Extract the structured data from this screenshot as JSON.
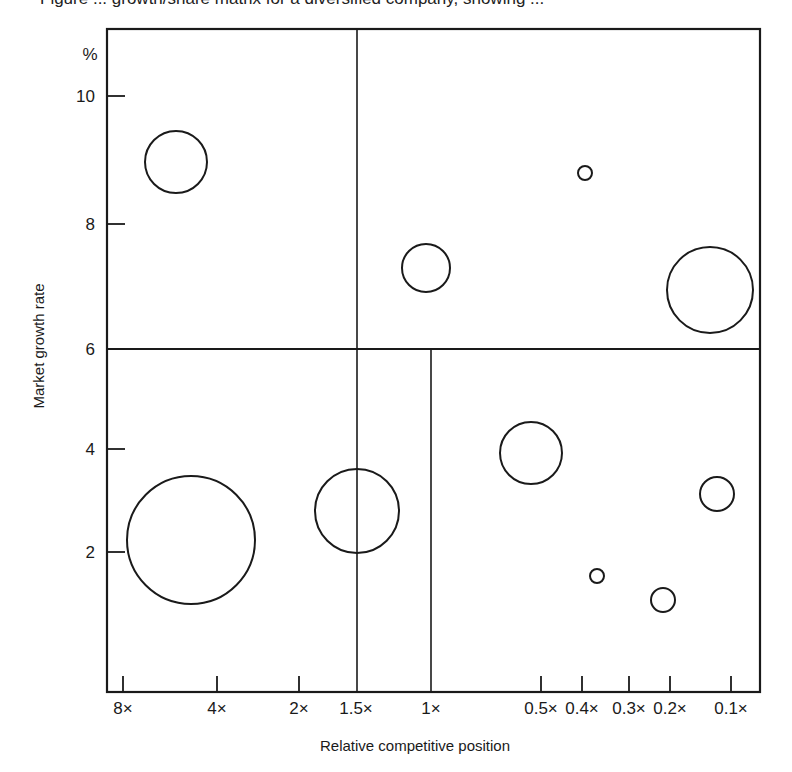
{
  "chart_data": {
    "type": "scatter",
    "subtype": "bubble",
    "title": "",
    "xlabel": "Relative competitive position",
    "ylabel": "Market growth rate",
    "y_unit_label": "%",
    "x_scale": "categorical-log (decreasing to right)",
    "x_ticks": [
      {
        "label": "8×",
        "value": 8,
        "px": 123,
        "tick": true
      },
      {
        "label": "4×",
        "value": 4,
        "px": 217,
        "tick": true
      },
      {
        "label": "2×",
        "value": 2,
        "px": 299,
        "tick": true
      },
      {
        "label": "1.5×",
        "value": 1.5,
        "px": 356,
        "tick": false
      },
      {
        "label": "1×",
        "value": 1,
        "px": 431,
        "tick": false
      },
      {
        "label": "0.5×",
        "value": 0.5,
        "px": 541,
        "tick": true
      },
      {
        "label": "0.4×",
        "value": 0.4,
        "px": 582,
        "tick": true
      },
      {
        "label": "0.3×",
        "value": 0.3,
        "px": 629,
        "tick": true
      },
      {
        "label": "0.2×",
        "value": 0.2,
        "px": 670,
        "tick": true
      },
      {
        "label": "0.1×",
        "value": 0.1,
        "px": 731,
        "tick": true
      }
    ],
    "y_ticks": [
      {
        "label": "10",
        "value": 10,
        "px": 96
      },
      {
        "label": "8",
        "value": 8,
        "px": 224
      },
      {
        "label": "6",
        "value": 6,
        "px": 349
      },
      {
        "label": "4",
        "value": 4,
        "px": 449
      },
      {
        "label": "2",
        "value": 2,
        "px": 552
      }
    ],
    "ylim": [
      0,
      11
    ],
    "grid": false,
    "legend": null,
    "dividers": {
      "horizontal_at_y": 6,
      "vertical_top_at_x": "1.5×",
      "vertical_bottom_left_at_x": "1.5×",
      "vertical_bottom_right_at_x": "1×"
    },
    "points": [
      {
        "x": 5.5,
        "y": 9.0,
        "size": "medium",
        "cx": 176,
        "cy": 162,
        "r": 31
      },
      {
        "x": 1.05,
        "y": 7.3,
        "size": "small-medium",
        "cx": 426,
        "cy": 268,
        "r": 24
      },
      {
        "x": 0.4,
        "y": 8.8,
        "size": "tiny",
        "cx": 585,
        "cy": 173,
        "r": 7
      },
      {
        "x": 0.14,
        "y": 6.9,
        "size": "large",
        "cx": 710,
        "cy": 290,
        "r": 43
      },
      {
        "x": 5.0,
        "y": 2.2,
        "size": "very large",
        "cx": 191,
        "cy": 540,
        "r": 64
      },
      {
        "x": 1.5,
        "y": 2.8,
        "size": "large",
        "cx": 357,
        "cy": 511,
        "r": 42
      },
      {
        "x": 0.55,
        "y": 3.9,
        "size": "medium",
        "cx": 531,
        "cy": 453,
        "r": 31
      },
      {
        "x": 0.13,
        "y": 3.1,
        "size": "small",
        "cx": 717,
        "cy": 494,
        "r": 17
      },
      {
        "x": 0.37,
        "y": 1.5,
        "size": "tiny",
        "cx": 597,
        "cy": 576,
        "r": 7
      },
      {
        "x": 0.22,
        "y": 1.1,
        "size": "small",
        "cx": 663,
        "cy": 600,
        "r": 12
      }
    ]
  },
  "layout": {
    "frame": {
      "left": 107,
      "top": 29,
      "right": 760,
      "bottom": 692
    },
    "hline_y": 349,
    "vline_top_x": 357,
    "vline_bottom_left_x": 357,
    "vline_bottom_right_x": 431,
    "ytick_len": 18,
    "xtick_len": 16,
    "stroke": "#1a1a1a"
  },
  "caption_clipped": "Figure ... growth/share matrix for a diversified company, showing ..."
}
